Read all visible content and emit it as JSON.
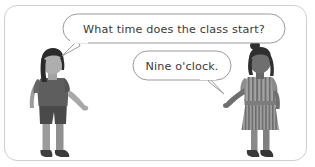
{
  "scene": {
    "title": "Two children conversation illustration",
    "background_color": "#ffffff",
    "frame": {
      "border_color": "#cfcfcf",
      "corner_radius": "13px"
    }
  },
  "speech_bubbles": [
    {
      "id": "question-bubble",
      "speaker": "left-child",
      "text": "What time does the class start?",
      "text_color": "#3a3a3a",
      "fill_color": "#ffffff",
      "stroke_color": "#9a9a9a",
      "tail_direction": "down-left"
    },
    {
      "id": "answer-bubble",
      "speaker": "right-child",
      "text": "Nine o'clock.",
      "text_color": "#3a3a3a",
      "fill_color": "#ffffff",
      "stroke_color": "#9a9a9a",
      "tail_direction": "down-right"
    }
  ],
  "figures": [
    {
      "id": "left-child",
      "role": "asker",
      "position": "left",
      "hair_color": "#2b2b2b",
      "hair_style": "long-bob-with-ponytail",
      "skin_color": "#a8a8a8",
      "shirt_color": "#5e5e5e",
      "shorts_color": "#4a4a4a",
      "legs_color": "#9b9b9b",
      "shoes_color": "#3f3f3f",
      "outfit": "t-shirt-and-shorts"
    },
    {
      "id": "right-child",
      "role": "answerer",
      "position": "right",
      "hair_color": "#2f2f2f",
      "hair_style": "topknot-bun",
      "skin_color": "#6f6f6f",
      "dress_color": "#9d9d9d",
      "dress_stripe_color": "#6b6b6b",
      "dress_pattern": "vertical-stripes",
      "legs_color": "#8a8a8a",
      "shoes_color": "#3a3a3a",
      "outfit": "striped-dress"
    }
  ]
}
